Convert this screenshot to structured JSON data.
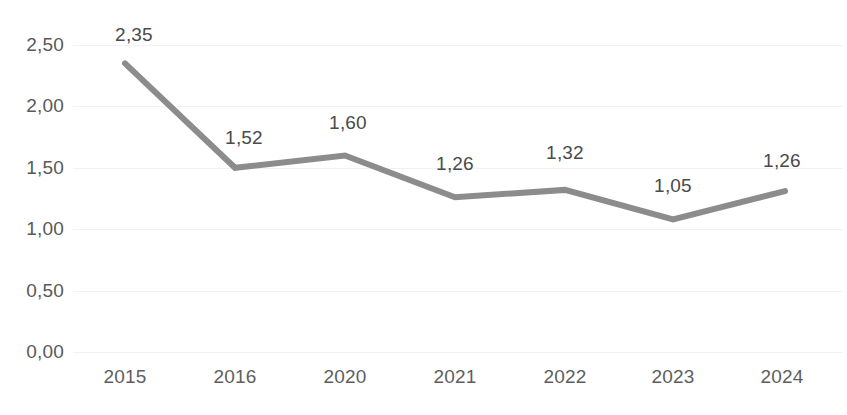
{
  "chart_data": {
    "type": "line",
    "title": "",
    "subtitle": "",
    "xlabel": "",
    "ylabel": "",
    "categories": [
      "2015",
      "2016",
      "2020",
      "2021",
      "2022",
      "2023",
      "2024"
    ],
    "values": [
      2.35,
      1.52,
      1.6,
      1.26,
      1.32,
      1.05,
      1.26
    ],
    "point_labels": [
      "2,35",
      "1,52",
      "1,60",
      "1,26",
      "1,32",
      "1,05",
      "1,26"
    ],
    "plotted_values": [
      2.35,
      1.5,
      1.6,
      1.26,
      1.32,
      1.08,
      1.31
    ],
    "ylim": [
      0,
      2.5
    ],
    "ytick_values": [
      0,
      0.5,
      1.0,
      1.5,
      2.0,
      2.5
    ],
    "ytick_labels": [
      "0,00",
      "0,50",
      "1,00",
      "1,50",
      "2,00",
      "2,50"
    ],
    "decimal_separator": ",",
    "grid": true,
    "grid_axis": "y",
    "legend": false,
    "legend_position": "none",
    "series": [
      {
        "name": "",
        "color": "#8c8c8c",
        "line_width": 6,
        "markers": false,
        "values": [
          2.35,
          1.52,
          1.6,
          1.26,
          1.32,
          1.05,
          1.26
        ]
      }
    ]
  },
  "style": {
    "background": "#ffffff",
    "line_color": "#8c8c8c",
    "grid_color": "#f2f2f2",
    "axis_text_color": "#5e5e5e",
    "label_text_color": "#4a4a4a"
  }
}
